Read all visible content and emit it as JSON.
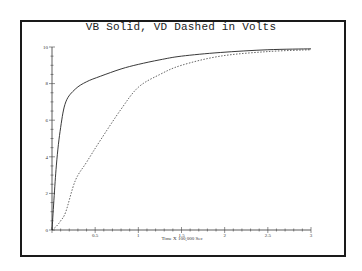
{
  "chart_data": {
    "type": "line",
    "title": "VB Solid, VD Dashed in Volts",
    "xlabel": "Time X 100,000 Sec",
    "ylabel": "",
    "xlim": [
      0,
      3
    ],
    "ylim": [
      0,
      10
    ],
    "x_ticks": [
      "0.5",
      "1",
      "1.5",
      "2",
      "2.5",
      "3"
    ],
    "y_ticks": [
      "0",
      "2",
      "4",
      "6",
      "8",
      "10"
    ],
    "grid": false,
    "legend": "none (encoded in title: VB solid, VD dashed)",
    "x": [
      0,
      0.05,
      0.1,
      0.16,
      0.27,
      0.4,
      0.56,
      0.8,
      1.0,
      1.25,
      1.5,
      1.95,
      2.5,
      3.0
    ],
    "series": [
      {
        "name": "VB",
        "style": "solid",
        "values": [
          0,
          3.5,
          5.6,
          7.0,
          7.7,
          8.1,
          8.4,
          8.8,
          9.05,
          9.3,
          9.5,
          9.7,
          9.85,
          9.9
        ]
      },
      {
        "name": "VD",
        "style": "dashed",
        "values": [
          0,
          0.2,
          0.5,
          1.0,
          2.7,
          3.7,
          4.9,
          6.6,
          7.8,
          8.5,
          9.0,
          9.5,
          9.75,
          9.85
        ]
      }
    ]
  }
}
